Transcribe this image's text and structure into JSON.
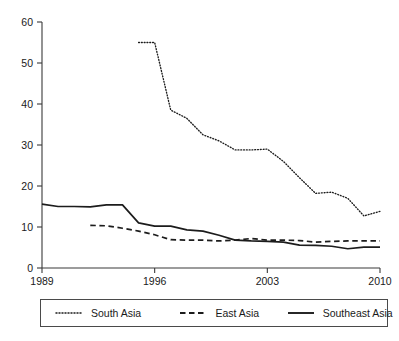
{
  "chart_data": {
    "type": "line",
    "title": "",
    "subtitle": "",
    "xlabel": "",
    "ylabel": "",
    "xlim": [
      1989,
      2010
    ],
    "ylim": [
      0,
      60
    ],
    "grid": false,
    "legend_position": "bottom",
    "x": [
      1989,
      1990,
      1991,
      1992,
      1993,
      1994,
      1995,
      1996,
      1997,
      1998,
      1999,
      2000,
      2001,
      2002,
      2003,
      2004,
      2005,
      2006,
      2007,
      2008,
      2009,
      2010
    ],
    "yticks": [
      0,
      10,
      20,
      30,
      40,
      50,
      60
    ],
    "ytick_labels": [
      "0",
      "10",
      "20",
      "30",
      "40",
      "50",
      "60"
    ],
    "xticks": [
      1989,
      1996,
      2003,
      2010
    ],
    "xtick_labels": [
      "1989",
      "1996",
      "2003",
      "2010"
    ],
    "series": [
      {
        "name": "South Asia",
        "style": "dotted",
        "color": "#1c1c1c",
        "x": [
          1995,
          1996,
          1997,
          1998,
          1999,
          2000,
          2001,
          2002,
          2003,
          2004,
          2005,
          2006,
          2007,
          2008,
          2009,
          2010
        ],
        "values": [
          55.0,
          55.0,
          38.5,
          36.5,
          32.5,
          31.0,
          28.8,
          28.8,
          29.0,
          26.0,
          22.0,
          18.2,
          18.5,
          17.0,
          12.7,
          13.8
        ]
      },
      {
        "name": "East Asia",
        "style": "dashed",
        "color": "#1c1c1c",
        "x": [
          1992,
          1993,
          1994,
          1995,
          1996,
          1997,
          1998,
          1999,
          2000,
          2001,
          2002,
          2003,
          2004,
          2005,
          2006,
          2007,
          2008,
          2009,
          2010
        ],
        "values": [
          10.4,
          10.3,
          9.7,
          9.0,
          8.1,
          6.9,
          6.8,
          6.8,
          6.6,
          6.8,
          7.2,
          6.8,
          6.8,
          6.7,
          6.3,
          6.5,
          6.6,
          6.6,
          6.6
        ]
      },
      {
        "name": "Southeast Asia",
        "style": "solid",
        "color": "#1c1c1c",
        "x": [
          1989,
          1990,
          1991,
          1992,
          1993,
          1994,
          1995,
          1996,
          1997,
          1998,
          1999,
          2000,
          2001,
          2002,
          2003,
          2004,
          2005,
          2006,
          2007,
          2008,
          2009,
          2010
        ],
        "values": [
          15.6,
          15.0,
          15.0,
          14.9,
          15.4,
          15.4,
          11.0,
          10.2,
          10.2,
          9.3,
          9.0,
          8.0,
          6.8,
          6.6,
          6.5,
          6.3,
          5.6,
          5.5,
          5.3,
          4.7,
          5.1,
          5.1
        ]
      }
    ]
  },
  "legend": {
    "entries": [
      {
        "label": "South Asia",
        "style": "dotted"
      },
      {
        "label": "East Asia",
        "style": "dashed"
      },
      {
        "label": "Southeast Asia",
        "style": "solid"
      }
    ]
  }
}
